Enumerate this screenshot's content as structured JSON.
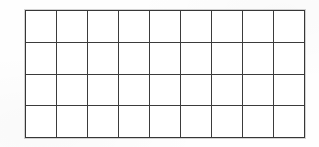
{
  "document": {
    "type": "blank-grid-table",
    "title": "Blank grid",
    "background_color": "#fefefe",
    "paper_color": "#ffffff"
  },
  "grid": {
    "columns": 9,
    "rows": 4,
    "line_color": "#3b3b3b",
    "line_width_px": 2,
    "cell_fill": "#ffffff",
    "bounds": {
      "left_px": 26,
      "top_px": 11,
      "right_px": 304,
      "bottom_px": 137,
      "cell_width_px": 31,
      "cell_height_px": 31
    },
    "column_headers": [
      "",
      "",
      "",
      "",
      "",
      "",
      "",
      "",
      ""
    ],
    "cells": [
      [
        "",
        "",
        "",
        "",
        "",
        "",
        "",
        "",
        ""
      ],
      [
        "",
        "",
        "",
        "",
        "",
        "",
        "",
        "",
        ""
      ],
      [
        "",
        "",
        "",
        "",
        "",
        "",
        "",
        "",
        ""
      ],
      [
        "",
        "",
        "",
        "",
        "",
        "",
        "",
        "",
        ""
      ]
    ]
  }
}
